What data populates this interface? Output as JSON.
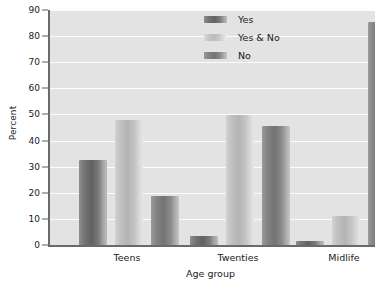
{
  "chart_data": {
    "type": "bar",
    "title": "",
    "subtitle": "",
    "xlabel": "Age group",
    "ylabel": "Percent",
    "categories": [
      "Teens",
      "Twenties",
      "Midlife"
    ],
    "series": [
      {
        "name": "Yes",
        "values": [
          32.5,
          3.5,
          1.7
        ]
      },
      {
        "name": "Yes & No",
        "values": [
          47.7,
          49.7,
          11.3
        ]
      },
      {
        "name": "No",
        "values": [
          18.7,
          45.5,
          85.5
        ]
      }
    ],
    "ylim": [
      0,
      90
    ],
    "yticks": [
      0,
      10,
      20,
      30,
      40,
      50,
      60,
      70,
      80,
      90
    ],
    "ytick_labels": [
      "0",
      "10",
      "20",
      "30",
      "40",
      "50",
      "60",
      "70",
      "80",
      "90"
    ],
    "grid": true,
    "grid_axis": "y",
    "grid_color": "#fdfdfd",
    "legend_position": "top-center",
    "legend_frame": false,
    "panel_background": "#e3e3e3",
    "figure_background": "#ffffff",
    "axis_color": "#6a6a6a",
    "series_colors": [
      "#757575",
      "#c4c4c4",
      "#878787"
    ],
    "bar_style": "cylindrical-gradient"
  }
}
